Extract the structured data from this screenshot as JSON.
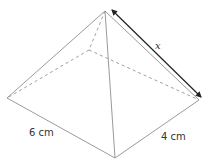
{
  "figure": {
    "type": "square-based pyramid (rectangular base)",
    "labels": {
      "length": "6 cm",
      "width": "4 cm",
      "slant_edge": "x"
    },
    "colors": {
      "edge": "#9a9a9a",
      "dimension_arrow": "#222222",
      "text": "#333333"
    }
  }
}
